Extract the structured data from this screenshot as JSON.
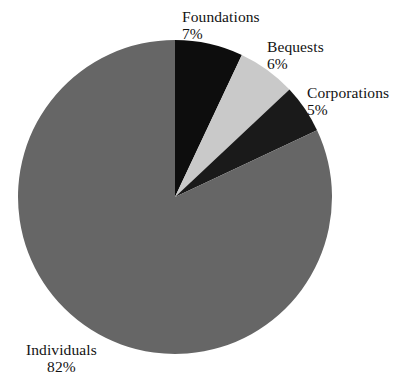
{
  "chart_data": {
    "type": "pie",
    "title": "",
    "xlabel": "",
    "ylabel": "",
    "legend_position": "none",
    "grid": false,
    "unit": "%",
    "start_angle_deg": 0,
    "direction": "clockwise",
    "categories": [
      "Foundations",
      "Bequests",
      "Corporations",
      "Individuals"
    ],
    "values": [
      7,
      6,
      5,
      82
    ],
    "colors": [
      "#0d0d0d",
      "#c9c9c9",
      "#1a1a1a",
      "#666666"
    ],
    "slices": [
      {
        "name": "Foundations",
        "value": 7,
        "value_label": "7%",
        "color": "#0d0d0d",
        "start_deg": 0,
        "end_deg": 25.2
      },
      {
        "name": "Bequests",
        "value": 6,
        "value_label": "6%",
        "color": "#c9c9c9",
        "start_deg": 25.2,
        "end_deg": 46.8
      },
      {
        "name": "Corporations",
        "value": 5,
        "value_label": "5%",
        "color": "#1a1a1a",
        "start_deg": 46.8,
        "end_deg": 64.8
      },
      {
        "name": "Individuals",
        "value": 82,
        "value_label": "82%",
        "color": "#666666",
        "start_deg": 64.8,
        "end_deg": 360
      }
    ]
  },
  "labels": {
    "foundations": {
      "name": "Foundations",
      "value": "7%"
    },
    "bequests": {
      "name": "Bequests",
      "value": "6%"
    },
    "corporations": {
      "name": "Corporations",
      "value": "5%"
    },
    "individuals": {
      "name": "Individuals",
      "value": "82%"
    }
  },
  "geometry": {
    "center_x": 175,
    "center_y": 197,
    "radius": 157
  },
  "colors": {
    "background": "#ffffff",
    "text": "#121212",
    "foundations": "#0d0d0d",
    "bequests": "#c9c9c9",
    "corporations": "#1a1a1a",
    "individuals": "#666666"
  }
}
